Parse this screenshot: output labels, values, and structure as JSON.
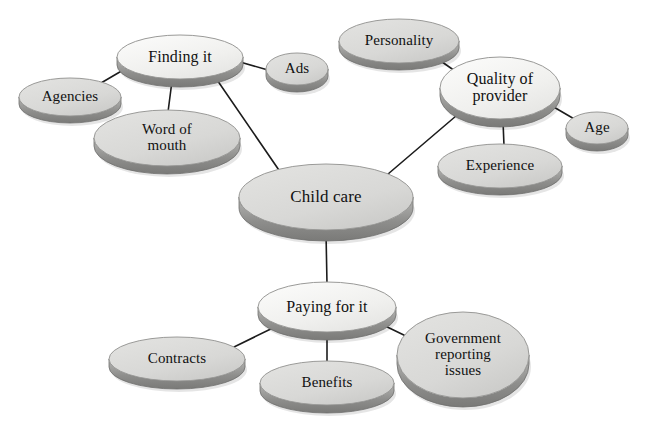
{
  "diagram": {
    "title": "Child care",
    "type": "concept-map",
    "background_color": "#ffffff",
    "text_color": "#111111",
    "connector_color": "#1c1c1c",
    "hub_fill_color": "#f0f0ee",
    "leaf_fill_color": "#d8d8d6",
    "rim_color": "#8e8e8c",
    "nodes": [
      {
        "id": "child-care",
        "label": "Child care",
        "role": "root",
        "cx": 326,
        "cy": 197,
        "rx": 87,
        "ry": 33,
        "depth": 11,
        "fill": "#d8d8d6",
        "font_size": 17
      },
      {
        "id": "finding-it",
        "label": "Finding it",
        "role": "branch",
        "cx": 180,
        "cy": 57,
        "rx": 63,
        "ry": 22,
        "depth": 8,
        "fill": "#f0f0ee",
        "font_size": 16
      },
      {
        "id": "agencies",
        "label": "Agencies",
        "role": "leaf",
        "cx": 70,
        "cy": 97,
        "rx": 51,
        "ry": 19,
        "depth": 7,
        "fill": "#d8d8d6",
        "font_size": 15
      },
      {
        "id": "word-of-mouth",
        "label": "Word of\nmouth",
        "role": "leaf",
        "cx": 167,
        "cy": 138,
        "rx": 73,
        "ry": 28,
        "depth": 8,
        "fill": "#d8d8d6",
        "font_size": 15
      },
      {
        "id": "ads",
        "label": "Ads",
        "role": "leaf",
        "cx": 297,
        "cy": 69,
        "rx": 31,
        "ry": 16,
        "depth": 7,
        "fill": "#d8d8d6",
        "font_size": 15
      },
      {
        "id": "quality-of-provider",
        "label": "Quality of\nprovider",
        "role": "branch",
        "cx": 500,
        "cy": 88,
        "rx": 60,
        "ry": 31,
        "depth": 8,
        "fill": "#f0f0ee",
        "font_size": 16
      },
      {
        "id": "personality",
        "label": "Personality",
        "role": "leaf",
        "cx": 399,
        "cy": 41,
        "rx": 60,
        "ry": 22,
        "depth": 7,
        "fill": "#d8d8d6",
        "font_size": 15
      },
      {
        "id": "age",
        "label": "Age",
        "role": "leaf",
        "cx": 597,
        "cy": 128,
        "rx": 31,
        "ry": 16,
        "depth": 7,
        "fill": "#d8d8d6",
        "font_size": 15
      },
      {
        "id": "experience",
        "label": "Experience",
        "role": "leaf",
        "cx": 500,
        "cy": 166,
        "rx": 62,
        "ry": 22,
        "depth": 7,
        "fill": "#d8d8d6",
        "font_size": 15
      },
      {
        "id": "paying-for-it",
        "label": "Paying for it",
        "role": "branch",
        "cx": 327,
        "cy": 307,
        "rx": 69,
        "ry": 25,
        "depth": 8,
        "fill": "#f0f0ee",
        "font_size": 16
      },
      {
        "id": "contracts",
        "label": "Contracts",
        "role": "leaf",
        "cx": 177,
        "cy": 359,
        "rx": 68,
        "ry": 22,
        "depth": 8,
        "fill": "#d8d8d6",
        "font_size": 15
      },
      {
        "id": "benefits",
        "label": "Benefits",
        "role": "leaf",
        "cx": 327,
        "cy": 383,
        "rx": 67,
        "ry": 22,
        "depth": 8,
        "fill": "#d8d8d6",
        "font_size": 15
      },
      {
        "id": "government-reporting-issues",
        "label": "Government\nreporting\nissues",
        "role": "leaf",
        "cx": 463,
        "cy": 355,
        "rx": 66,
        "ry": 43,
        "depth": 9,
        "fill": "#d8d8d6",
        "font_size": 15
      }
    ],
    "edges": [
      {
        "id": "edge-childcare-findingit",
        "from": "child-care",
        "to": "finding-it",
        "x1": 283,
        "y1": 176,
        "x2": 213,
        "y2": 74
      },
      {
        "id": "edge-childcare-quality",
        "from": "child-care",
        "to": "quality-of-provider",
        "x1": 381,
        "y1": 180,
        "x2": 463,
        "y2": 110
      },
      {
        "id": "edge-childcare-paying",
        "from": "child-care",
        "to": "paying-for-it",
        "x1": 326,
        "y1": 232,
        "x2": 327,
        "y2": 284
      },
      {
        "id": "edge-findingit-agencies",
        "from": "finding-it",
        "to": "agencies",
        "x1": 130,
        "y1": 66,
        "x2": 101,
        "y2": 83
      },
      {
        "id": "edge-findingit-wordofmouth",
        "from": "finding-it",
        "to": "word-of-mouth",
        "x1": 172,
        "y1": 81,
        "x2": 168,
        "y2": 112
      },
      {
        "id": "edge-findingit-ads",
        "from": "finding-it",
        "to": "ads",
        "x1": 240,
        "y1": 62,
        "x2": 268,
        "y2": 70
      },
      {
        "id": "edge-quality-personality",
        "from": "quality-of-provider",
        "to": "personality",
        "x1": 455,
        "y1": 71,
        "x2": 435,
        "y2": 57
      },
      {
        "id": "edge-quality-age",
        "from": "quality-of-provider",
        "to": "age",
        "x1": 552,
        "y1": 106,
        "x2": 576,
        "y2": 120
      },
      {
        "id": "edge-quality-experience",
        "from": "quality-of-provider",
        "to": "experience",
        "x1": 503,
        "y1": 121,
        "x2": 504,
        "y2": 146
      },
      {
        "id": "edge-paying-contracts",
        "from": "paying-for-it",
        "to": "contracts",
        "x1": 279,
        "y1": 325,
        "x2": 234,
        "y2": 347
      },
      {
        "id": "edge-paying-benefits",
        "from": "paying-for-it",
        "to": "benefits",
        "x1": 327,
        "y1": 334,
        "x2": 327,
        "y2": 363
      },
      {
        "id": "edge-paying-government",
        "from": "paying-for-it",
        "to": "government-reporting-issues",
        "x1": 379,
        "y1": 323,
        "x2": 410,
        "y2": 338
      }
    ]
  }
}
